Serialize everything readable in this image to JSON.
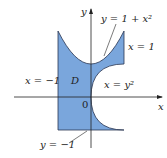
{
  "figure": {
    "region_label": "D",
    "origin_label": "0",
    "axis_x_label": "x",
    "axis_y_label": "y",
    "curves": [
      {
        "id": "upper",
        "label": "y = 1 + x²"
      },
      {
        "id": "right-line",
        "label": "x = 1"
      },
      {
        "id": "left-line",
        "label": "x = −1"
      },
      {
        "id": "inner-parabola",
        "label": "x = y²"
      },
      {
        "id": "bottom-line",
        "label": "y = −1"
      }
    ],
    "colors": {
      "fill": "#7aa6dc",
      "stroke": "#2a3550",
      "axis": "#222222"
    }
  }
}
